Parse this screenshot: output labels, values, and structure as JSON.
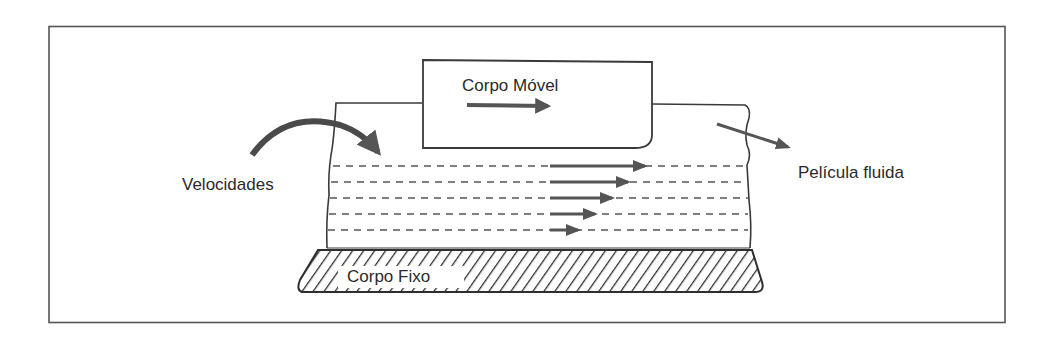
{
  "diagram": {
    "type": "lubrication-fluid-film-schematic",
    "labels": {
      "moving_body": "Corpo Móvel",
      "fixed_body": "Corpo Fixo",
      "velocities": "Velocidades",
      "fluid_film": "Película fluida"
    },
    "velocity_profile": {
      "layers": 5,
      "arrow_tip_x": [
        645,
        628,
        612,
        595,
        578
      ],
      "layer_y": [
        166,
        182,
        198,
        214,
        230
      ],
      "arrow_start_x": 550
    },
    "colors": {
      "line": "#3a3a3a",
      "arrow": "#555555",
      "background": "#ffffff",
      "frame": "#555555"
    }
  }
}
